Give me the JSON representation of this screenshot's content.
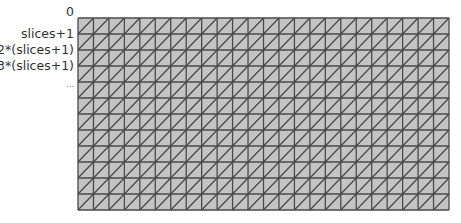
{
  "diagram": {
    "row_labels": [
      "0",
      "slices+1",
      "2*(slices+1)",
      "3*(slices+1)",
      "..."
    ],
    "grid": {
      "columns": 24,
      "rows": 12,
      "diagonal_direction": "bottom-left-to-top-right"
    },
    "colors": {
      "fill": "#c4c4c4",
      "line": "#4a4a4a",
      "label": "#333333"
    }
  }
}
